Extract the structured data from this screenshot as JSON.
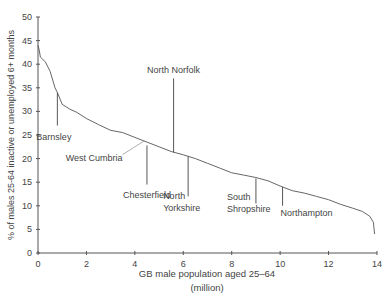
{
  "chart_data": {
    "type": "line",
    "title": "",
    "xlabel": "GB male population aged 25–64",
    "xlabel_sub": "(million)",
    "ylabel": "% of males 25-64 inactive or unemployed 6+ months",
    "xlim": [
      0,
      14
    ],
    "ylim": [
      0,
      50
    ],
    "x_ticks": [
      "0",
      "2",
      "4",
      "6",
      "8",
      "10",
      "12",
      "14"
    ],
    "y_ticks": [
      "0",
      "5",
      "10",
      "15",
      "20",
      "25",
      "30",
      "35",
      "40",
      "45",
      "50"
    ],
    "grid": false,
    "series": [
      {
        "name": "Cumulative distribution",
        "x": [
          0,
          0.05,
          0.1,
          0.3,
          0.5,
          0.7,
          0.8,
          1.0,
          1.3,
          1.6,
          2.0,
          2.5,
          3.0,
          3.5,
          4.0,
          4.5,
          5.0,
          5.5,
          6.0,
          6.5,
          7.0,
          7.5,
          8.0,
          8.5,
          9.0,
          9.5,
          10.0,
          10.5,
          11.0,
          11.5,
          12.0,
          12.5,
          13.0,
          13.4,
          13.7,
          13.85,
          13.9
        ],
        "y": [
          44,
          43,
          41.5,
          40.5,
          38.5,
          35,
          34,
          31.5,
          30.5,
          29.8,
          28.5,
          27.2,
          26,
          25.5,
          24.5,
          23.5,
          22.5,
          21.5,
          20.8,
          20,
          19,
          18,
          17,
          16.5,
          16,
          15.3,
          14.2,
          13.2,
          12.7,
          12,
          11.3,
          10.3,
          9.5,
          8.8,
          7.8,
          6.5,
          4
        ]
      }
    ],
    "annotations": [
      {
        "label": "Barnsley",
        "x": 0.8,
        "y": 34,
        "line_to_y": 27
      },
      {
        "label": "West Cumbria",
        "x": 4.4,
        "y": 23.8,
        "line_to_y": 20
      },
      {
        "label": "North Norfolk",
        "x": 5.6,
        "y": 21.3,
        "line_to_y": 37
      },
      {
        "label": "Chesterfield",
        "x": 4.5,
        "y": 22.8,
        "line_to_y": 14.5
      },
      {
        "label": "North Yorkshire",
        "x": 6.2,
        "y": 20.5,
        "line_to_y": 12
      },
      {
        "label": "South Shropshire",
        "x": 9.0,
        "y": 15.8,
        "line_to_y": 10.5
      },
      {
        "label": "Northampton",
        "x": 10.1,
        "y": 14,
        "line_to_y": 10
      }
    ]
  }
}
